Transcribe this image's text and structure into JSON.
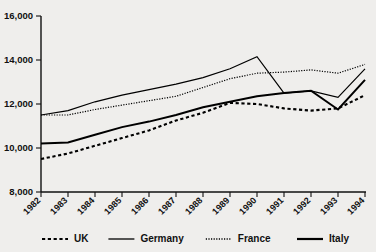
{
  "chart_data": {
    "type": "line",
    "title": "",
    "subtitle": "",
    "xlabel": "",
    "ylabel": "",
    "grid": false,
    "legend_position": "bottom",
    "x": [
      "1982",
      "1983",
      "1984",
      "1985",
      "1986",
      "1987",
      "1988",
      "1989",
      "1990",
      "1991",
      "1992",
      "1993",
      "1994"
    ],
    "xtick_labels": [
      "1982",
      "1983",
      "1984",
      "1985",
      "1986",
      "1987",
      "1988",
      "1989",
      "1990",
      "1991",
      "1992",
      "1993",
      "1994"
    ],
    "ytick_labels": [
      "8,000",
      "10,000",
      "12,000",
      "14,000",
      "16,000"
    ],
    "yticks": [
      8000,
      10000,
      12000,
      14000,
      16000
    ],
    "ylim": [
      8000,
      16000
    ],
    "xlim": [
      "1982",
      "1994"
    ],
    "series": [
      {
        "name": "UK",
        "style": "dashed",
        "values": [
          9500,
          9750,
          10100,
          10450,
          10800,
          11250,
          11600,
          12050,
          12000,
          11800,
          11700,
          11800,
          12400
        ]
      },
      {
        "name": "Germany",
        "style": "solid-thin",
        "values": [
          11500,
          11700,
          12100,
          12400,
          12650,
          12900,
          13200,
          13600,
          14150,
          12500,
          12600,
          12300,
          13600
        ]
      },
      {
        "name": "France",
        "style": "dotted",
        "values": [
          11500,
          11500,
          11750,
          11950,
          12150,
          12350,
          12750,
          13150,
          13400,
          13450,
          13550,
          13400,
          13800
        ]
      },
      {
        "name": "Italy",
        "style": "solid-thick",
        "values": [
          10200,
          10250,
          10600,
          10950,
          11200,
          11500,
          11850,
          12100,
          12350,
          12500,
          12600,
          11750,
          13100
        ]
      }
    ]
  },
  "legend": {
    "entries": [
      {
        "label": "UK",
        "style": "dashed"
      },
      {
        "label": "Germany",
        "style": "solid-thin"
      },
      {
        "label": "France",
        "style": "dotted"
      },
      {
        "label": "Italy",
        "style": "solid-thick"
      }
    ]
  },
  "colors": {
    "background": "#efeeec",
    "ink": "#111111",
    "series": "#000000"
  }
}
